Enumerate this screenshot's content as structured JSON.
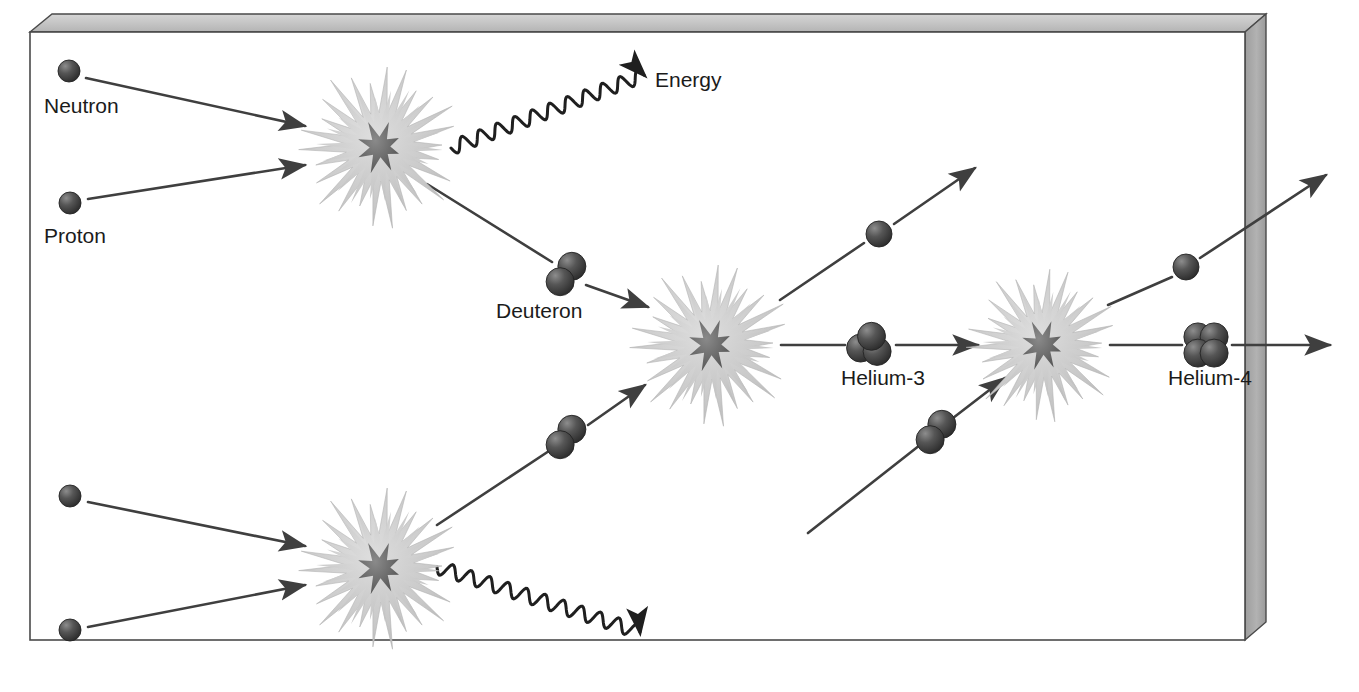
{
  "diagram": {
    "background": "#ffffff",
    "frame": {
      "name": "3d-box-frame",
      "fill": "#ffffff",
      "edge_stroke": "#3a3a3a",
      "bevel_fill": "#c9c9c9",
      "side_fill": "#a8a8a8",
      "inner_x": 30,
      "inner_y": 32,
      "inner_w": 1215,
      "inner_h": 608
    },
    "colors": {
      "particle_dark": "#3a3a3a",
      "particle_light": "#6e6e6e",
      "burst_outer": "#cccccc",
      "burst_inner": "#6b6b6b",
      "arrow": "#3f3f3f",
      "text": "#1b1b1b"
    },
    "labels": [
      {
        "id": "neutron",
        "text": "Neutron",
        "x": 44,
        "y": 113,
        "anchor": "start"
      },
      {
        "id": "proton",
        "text": "Proton",
        "x": 44,
        "y": 243,
        "anchor": "start"
      },
      {
        "id": "energy",
        "text": "Energy",
        "x": 655,
        "y": 87,
        "anchor": "start"
      },
      {
        "id": "deuteron",
        "text": "Deuteron",
        "x": 496,
        "y": 318,
        "anchor": "start"
      },
      {
        "id": "helium3",
        "text": "Helium-3",
        "x": 841,
        "y": 385,
        "anchor": "start"
      },
      {
        "id": "helium4",
        "text": "Helium-4",
        "x": 1168,
        "y": 385,
        "anchor": "start"
      }
    ],
    "particles": [
      {
        "id": "neutron-top",
        "kind": "single",
        "cx": 69,
        "cy": 71,
        "r": 11
      },
      {
        "id": "proton-top",
        "kind": "single",
        "cx": 70,
        "cy": 203,
        "r": 11
      },
      {
        "id": "neutron-bottom",
        "kind": "single",
        "cx": 70,
        "cy": 496,
        "r": 11
      },
      {
        "id": "proton-bottom",
        "kind": "single",
        "cx": 70,
        "cy": 630,
        "r": 11
      },
      {
        "id": "deuteron-upper",
        "kind": "deuteron",
        "cx": 566,
        "cy": 274,
        "r": 14
      },
      {
        "id": "deuteron-lower",
        "kind": "deuteron",
        "cx": 566,
        "cy": 437,
        "r": 14
      },
      {
        "id": "deuteron-right",
        "kind": "deuteron",
        "cx": 936,
        "cy": 432,
        "r": 14
      },
      {
        "id": "proton-ejected-mid",
        "kind": "single",
        "cx": 879,
        "cy": 234,
        "r": 13
      },
      {
        "id": "proton-ejected-right",
        "kind": "single",
        "cx": 1186,
        "cy": 267,
        "r": 13
      },
      {
        "id": "helium3-nucleus",
        "kind": "helium3",
        "cx": 869,
        "cy": 345,
        "r": 14
      },
      {
        "id": "helium4-nucleus",
        "kind": "helium4",
        "cx": 1206,
        "cy": 345,
        "r": 14
      }
    ],
    "bursts": [
      {
        "id": "burst-top-left",
        "cx": 380,
        "cy": 147,
        "r": 74
      },
      {
        "id": "burst-bottom-left",
        "cx": 380,
        "cy": 568,
        "r": 74
      },
      {
        "id": "burst-middle",
        "cx": 711,
        "cy": 345,
        "r": 74
      },
      {
        "id": "burst-right",
        "cx": 1043,
        "cy": 345,
        "r": 70
      }
    ],
    "arrows": [
      {
        "id": "neutron-top-to-burst",
        "x1": 86,
        "y1": 78,
        "x2": 305,
        "y2": 126,
        "head": true
      },
      {
        "id": "proton-top-to-burst",
        "x1": 88,
        "y1": 199,
        "x2": 305,
        "y2": 165,
        "head": true
      },
      {
        "id": "neutron-bottom-to-burst",
        "x1": 88,
        "y1": 502,
        "x2": 305,
        "y2": 546,
        "head": true
      },
      {
        "id": "proton-bottom-to-burst",
        "x1": 88,
        "y1": 627,
        "x2": 305,
        "y2": 585,
        "head": true
      },
      {
        "id": "burst-to-deuteron-upper",
        "x1": 427,
        "y1": 184,
        "x2": 552,
        "y2": 262,
        "head": false
      },
      {
        "id": "deuteron-upper-to-middle",
        "x1": 586,
        "y1": 285,
        "x2": 648,
        "y2": 307,
        "head": true
      },
      {
        "id": "burst-bottom-to-deuteron",
        "x1": 437,
        "y1": 525,
        "x2": 552,
        "y2": 449,
        "head": false
      },
      {
        "id": "deuteron-lower-to-middle",
        "x1": 588,
        "y1": 425,
        "x2": 645,
        "y2": 385,
        "head": true
      },
      {
        "id": "middle-to-proton-eject",
        "x1": 780,
        "y1": 300,
        "x2": 864,
        "y2": 243,
        "head": false
      },
      {
        "id": "proton-eject-out",
        "x1": 894,
        "y1": 224,
        "x2": 975,
        "y2": 168,
        "head": true
      },
      {
        "id": "middle-to-helium3",
        "x1": 781,
        "y1": 345,
        "x2": 845,
        "y2": 345,
        "head": false
      },
      {
        "id": "helium3-to-right-burst",
        "x1": 896,
        "y1": 345,
        "x2": 978,
        "y2": 345,
        "head": true
      },
      {
        "id": "deuteron-right-inbound",
        "x1": 808,
        "y1": 533,
        "x2": 920,
        "y2": 445,
        "head": false
      },
      {
        "id": "deuteron-right-to-burst",
        "x1": 953,
        "y1": 418,
        "x2": 1005,
        "y2": 378,
        "head": true
      },
      {
        "id": "right-to-proton-eject",
        "x1": 1108,
        "y1": 305,
        "x2": 1172,
        "y2": 277,
        "head": false
      },
      {
        "id": "proton-eject-exit",
        "x1": 1200,
        "y1": 258,
        "x2": 1326,
        "y2": 175,
        "head": true
      },
      {
        "id": "right-to-helium4",
        "x1": 1110,
        "y1": 345,
        "x2": 1182,
        "y2": 345,
        "head": false
      },
      {
        "id": "helium4-exit",
        "x1": 1232,
        "y1": 345,
        "x2": 1330,
        "y2": 345,
        "head": true
      }
    ],
    "energy_waves": [
      {
        "id": "energy-wave-top",
        "x1": 451,
        "y1": 148,
        "x2": 644,
        "y2": 75,
        "amplitude": 7,
        "cycles": 11
      },
      {
        "id": "energy-wave-bottom",
        "x1": 437,
        "y1": 567,
        "x2": 640,
        "y2": 632,
        "amplitude": 7,
        "cycles": 11
      }
    ]
  }
}
